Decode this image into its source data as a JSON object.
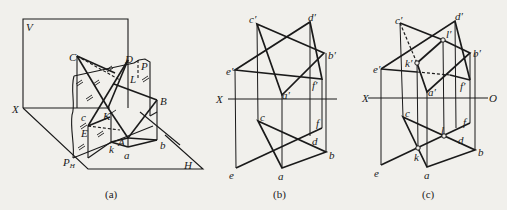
{
  "figure": {
    "panels": [
      {
        "id": "a",
        "caption": "(a)",
        "labels": {
          "V": "V",
          "X": "X",
          "C": "C",
          "D": "D",
          "P": "P",
          "L": "L",
          "B": "B",
          "c": "c",
          "K": "K",
          "E": "E",
          "A": "A",
          "k": "k",
          "a": "a",
          "b": "b",
          "P_H_main": "P",
          "P_H_sub": "H",
          "H": "H"
        }
      },
      {
        "id": "b",
        "caption": "(b)",
        "labels": {
          "c_prime": "c′",
          "d_prime": "d′",
          "b_prime": "b′",
          "e_prime": "e′",
          "a_prime": "a′",
          "f_prime": "f′",
          "X": "X",
          "O": "O",
          "c": "c",
          "f": "f",
          "d": "d",
          "b": "b",
          "e": "e",
          "a": "a"
        }
      },
      {
        "id": "c",
        "caption": "(c)",
        "labels": {
          "c_prime": "c′",
          "d_prime": "d′",
          "l_prime": "l′",
          "b_prime": "b′",
          "e_prime": "e′",
          "k_prime": "k′",
          "a_prime": "a′",
          "f_prime": "f′",
          "X": "X",
          "O": "O",
          "c": "c",
          "l": "l",
          "d": "d",
          "f": "f",
          "b": "b",
          "k": "k",
          "e": "e",
          "a": "a"
        }
      }
    ],
    "colors": {
      "line": "#1a1a1a",
      "background": "#f1f0ec"
    }
  }
}
